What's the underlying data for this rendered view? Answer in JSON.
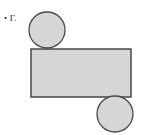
{
  "figure": {
    "canvas": {
      "width": 143,
      "height": 135,
      "background": "#ffffff"
    },
    "palette": {
      "shape_fill": "#d6d6d6",
      "shape_stroke": "#4a4a4a",
      "rect_stroke": "#3d3d3d",
      "text_color": "#1b1b1b"
    },
    "label": {
      "bullet": "•",
      "text": "Γ."
    },
    "shapes": [
      {
        "name": "top-circle",
        "type": "circle",
        "cx": 47,
        "cy": 30,
        "r": 18,
        "fill": "#d6d6d6",
        "stroke": "#4a4a4a",
        "stroke_width": 1.3
      },
      {
        "name": "main-rectangle",
        "type": "rect",
        "x": 31,
        "y": 49,
        "width": 100,
        "height": 48,
        "fill": "#d6d6d6",
        "stroke": "#3d3d3d",
        "stroke_width": 1.4
      },
      {
        "name": "bottom-circle",
        "type": "circle",
        "cx": 115,
        "cy": 114,
        "r": 18,
        "fill": "#d6d6d6",
        "stroke": "#4a4a4a",
        "stroke_width": 1.3
      }
    ]
  }
}
